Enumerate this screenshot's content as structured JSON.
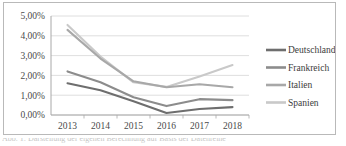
{
  "chart_data": {
    "type": "line",
    "title": "",
    "xlabel": "",
    "ylabel": "",
    "categories": [
      "2013",
      "2014",
      "2015",
      "2016",
      "2017",
      "2018"
    ],
    "ylim": [
      0,
      5
    ],
    "ytick_labels": [
      "0,00%",
      "1,00%",
      "2,00%",
      "3,00%",
      "4,00%",
      "5,00%"
    ],
    "ytick_values": [
      0,
      1,
      2,
      3,
      4,
      5
    ],
    "grid": true,
    "legend_position": "right",
    "value_suffix": "%",
    "series": [
      {
        "name": "Deutschland",
        "color": "#6e6e6e",
        "values": [
          1.6,
          1.25,
          0.7,
          0.1,
          0.3,
          0.4
        ]
      },
      {
        "name": "Frankreich",
        "color": "#8c8c8c",
        "values": [
          2.2,
          1.65,
          0.9,
          0.45,
          0.8,
          0.75
        ]
      },
      {
        "name": "Italien",
        "color": "#a8a8a8",
        "values": [
          4.3,
          2.85,
          1.7,
          1.4,
          1.55,
          1.4
        ]
      },
      {
        "name": "Spanien",
        "color": "#c9c9c9",
        "values": [
          4.55,
          2.95,
          1.65,
          1.42,
          1.95,
          2.52
        ]
      }
    ]
  },
  "caption": {
    "text": "Abb. 1: Darstellung der eigenen Berechnung auf Basis der Datenreihe"
  }
}
